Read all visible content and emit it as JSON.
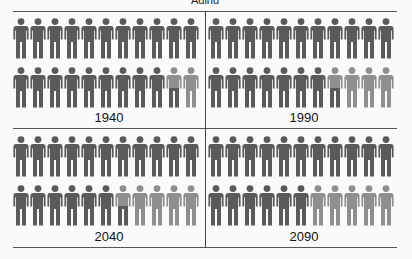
{
  "title": "Aging population",
  "colors": {
    "dark": "#5a5a5a",
    "light": "#8f8f8f",
    "line": "#555555"
  },
  "figures_per_panel": 22,
  "panels": [
    {
      "label": "1940",
      "dark_full": 20,
      "partial": 1,
      "light": 1
    },
    {
      "label": "1990",
      "dark_full": 18,
      "partial": 1,
      "light": 3
    },
    {
      "label": "2040",
      "dark_full": 17,
      "partial": 1,
      "light": 4
    },
    {
      "label": "2090",
      "dark_full": 17,
      "partial": 0,
      "light": 5
    }
  ]
}
